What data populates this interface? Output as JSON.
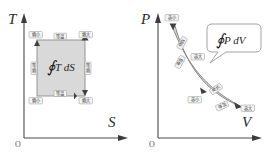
{
  "figure": {
    "panels": [
      {
        "id": "ts-diagram",
        "name": "temperature-entropy-diagram",
        "y_axis_label": "T",
        "x_axis_label": "S",
        "origin_label": "O",
        "integral_sign": "∮",
        "integral_body": "T dS",
        "corner_tags": [
          {
            "name": "tag-entropy-small-top",
            "text": "熵小"
          },
          {
            "name": "tag-entropy-large-top",
            "text": "熵大"
          },
          {
            "name": "tag-entropy-small-bottom",
            "text": "熵小"
          },
          {
            "name": "tag-entropy-large-bottom",
            "text": "熵大"
          }
        ],
        "edge_labels": [
          {
            "name": "edge-top-isothermal",
            "text": "等温"
          },
          {
            "name": "edge-bottom-isothermal",
            "text": "等温"
          },
          {
            "name": "edge-left-isentropic",
            "text": "等熵"
          },
          {
            "name": "edge-right-isentropic",
            "text": "等熵"
          }
        ]
      },
      {
        "id": "pv-diagram",
        "name": "pressure-volume-diagram",
        "y_axis_label": "P",
        "x_axis_label": "V",
        "origin_label": "O",
        "integral_sign": "∮",
        "integral_body": "P dV",
        "curve_tags": [
          {
            "name": "tag-volume-small-top",
            "text": "容小"
          },
          {
            "name": "tag-volume-large-mid",
            "text": "容大"
          },
          {
            "name": "tag-volume-small-low",
            "text": "容小"
          },
          {
            "name": "tag-volume-large-end",
            "text": "容大"
          }
        ],
        "curve_edge_labels": [
          {
            "name": "edge-upper-adiabatic",
            "text": "绝热"
          },
          {
            "name": "edge-upper-isothermal",
            "text": "等温"
          },
          {
            "name": "edge-lower-adiabatic",
            "text": "绝热"
          },
          {
            "name": "edge-lower-isothermal",
            "text": "等温"
          }
        ]
      }
    ],
    "colors": {
      "axis": "#4a4a4a",
      "fill": "#d2d2d2",
      "curve": "#7d7d7d",
      "tag_bg": "#f4f4f4",
      "text": "#2b2b2b"
    }
  }
}
